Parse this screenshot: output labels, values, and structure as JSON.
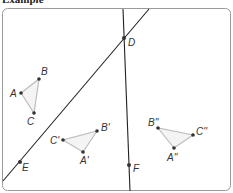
{
  "heading": "Example",
  "colors": {
    "frame": "#9a9a9a",
    "line": "#222222",
    "triangle_edge": "#bdbdbd",
    "triangle_fill": "#f4f4f4",
    "point": "#333333"
  },
  "lines": [
    {
      "name": "line-ED",
      "x1": 3,
      "y1": 181,
      "x2": 149,
      "y2": 9
    },
    {
      "name": "line-DF",
      "x1": 123,
      "y1": 9,
      "x2": 130,
      "y2": 191
    }
  ],
  "points": {
    "D": {
      "label": "D",
      "x": 124,
      "y": 38,
      "lx": 128,
      "ly": 46
    },
    "E": {
      "label": "E",
      "x": 20,
      "y": 162,
      "lx": 22,
      "ly": 171
    },
    "F": {
      "label": "F",
      "x": 129,
      "y": 165,
      "lx": 133,
      "ly": 172
    }
  },
  "triangles": [
    {
      "name": "ABC",
      "vertices": [
        {
          "label": "A",
          "x": 21,
          "y": 93,
          "lx": 10,
          "ly": 97
        },
        {
          "label": "B",
          "x": 39,
          "y": 79,
          "lx": 41,
          "ly": 75
        },
        {
          "label": "C",
          "x": 34,
          "y": 113,
          "lx": 27,
          "ly": 125
        }
      ]
    },
    {
      "name": "A'B'C'",
      "vertices": [
        {
          "label": "A'",
          "x": 83,
          "y": 152,
          "lx": 80,
          "ly": 164
        },
        {
          "label": "B'",
          "x": 97,
          "y": 131,
          "lx": 101,
          "ly": 131
        },
        {
          "label": "C'",
          "x": 63,
          "y": 140,
          "lx": 50,
          "ly": 144
        }
      ]
    },
    {
      "name": "A''B''C''",
      "vertices": [
        {
          "label": "A''",
          "x": 174,
          "y": 148,
          "lx": 167,
          "ly": 161
        },
        {
          "label": "B''",
          "x": 158,
          "y": 128,
          "lx": 148,
          "ly": 126
        },
        {
          "label": "C''",
          "x": 193,
          "y": 135,
          "lx": 196,
          "ly": 135
        }
      ]
    }
  ]
}
